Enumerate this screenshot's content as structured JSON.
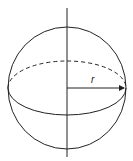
{
  "diagram": {
    "radius_label": "r",
    "elements": [
      "sphere-outline",
      "equator-front",
      "equator-back-dashed",
      "vertical-axis",
      "radius-arrow"
    ],
    "colors": {
      "line": "#222222",
      "background": "#ffffff"
    }
  }
}
